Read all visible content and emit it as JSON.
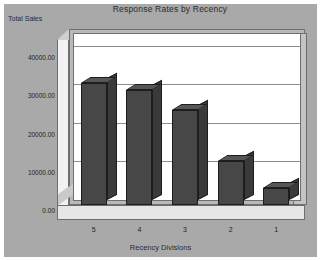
{
  "chart_data": {
    "type": "bar",
    "title": "Response Rates by Recency",
    "xlabel": "Recency Divisions",
    "ylabel": "Total Sales",
    "categories": [
      "5",
      "4",
      "3",
      "2",
      "1"
    ],
    "values": [
      32000,
      30000,
      25000,
      11500,
      4500
    ],
    "ytick_labels": [
      "40000.00",
      "30000.00",
      "20000.00",
      "10000.00",
      "0.00"
    ],
    "ytick_values": [
      40000,
      30000,
      20000,
      10000,
      0
    ],
    "ylim": [
      0,
      44000
    ],
    "grid": true,
    "legend": "none",
    "style": "3d-column",
    "colors": {
      "bar_front": "#474747",
      "bar_side": "#3a3a3a",
      "bar_top": "#565656",
      "plot_background": "#ffffff",
      "chart_background": "#a9a9a9",
      "gridline": "#8d8d8d",
      "axis_line": "#6f6f6f",
      "text": "#1e1e1e"
    }
  }
}
